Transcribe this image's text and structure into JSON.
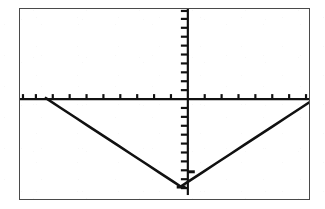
{
  "screen": {
    "device_label": "graphing-calculator-screen",
    "background_color": "#ffffff",
    "frame_color": "#4a4a4a",
    "ink_color": "#111111"
  },
  "chart_data": {
    "type": "line",
    "title": "",
    "subtitle": "",
    "xlabel": "",
    "ylabel": "",
    "xlim": [
      -10,
      10
    ],
    "ylim": [
      -10,
      10
    ],
    "xtick_step": 1,
    "ytick_step": 1,
    "grid": false,
    "legend": false,
    "axes_visible": true,
    "axis_style": "tick-marked-crosshair",
    "series": [
      {
        "name": "y = |x + 0.5| - 9.4",
        "style": "pixelated-solid",
        "color": "#111111",
        "x": [
          -10.0,
          -9.0,
          -8.0,
          -7.0,
          -6.0,
          -5.0,
          -4.0,
          -3.0,
          -2.0,
          -1.0,
          -0.5,
          0.0,
          1.0,
          2.0,
          3.0,
          4.0,
          5.0,
          6.0,
          7.0,
          8.0,
          9.0,
          10.0
        ],
        "y": [
          0.1,
          -0.9,
          -1.9,
          -2.9,
          -3.9,
          -4.9,
          -5.9,
          -6.9,
          -7.9,
          -8.9,
          -9.4,
          -8.9,
          -7.9,
          -6.9,
          -5.9,
          -4.9,
          -3.9,
          -2.9,
          -1.9,
          -0.9,
          0.1,
          0.6
        ]
      }
    ],
    "annotations": [
      {
        "kind": "vertex",
        "x": -0.5,
        "y": -9.4,
        "label": ""
      }
    ]
  }
}
